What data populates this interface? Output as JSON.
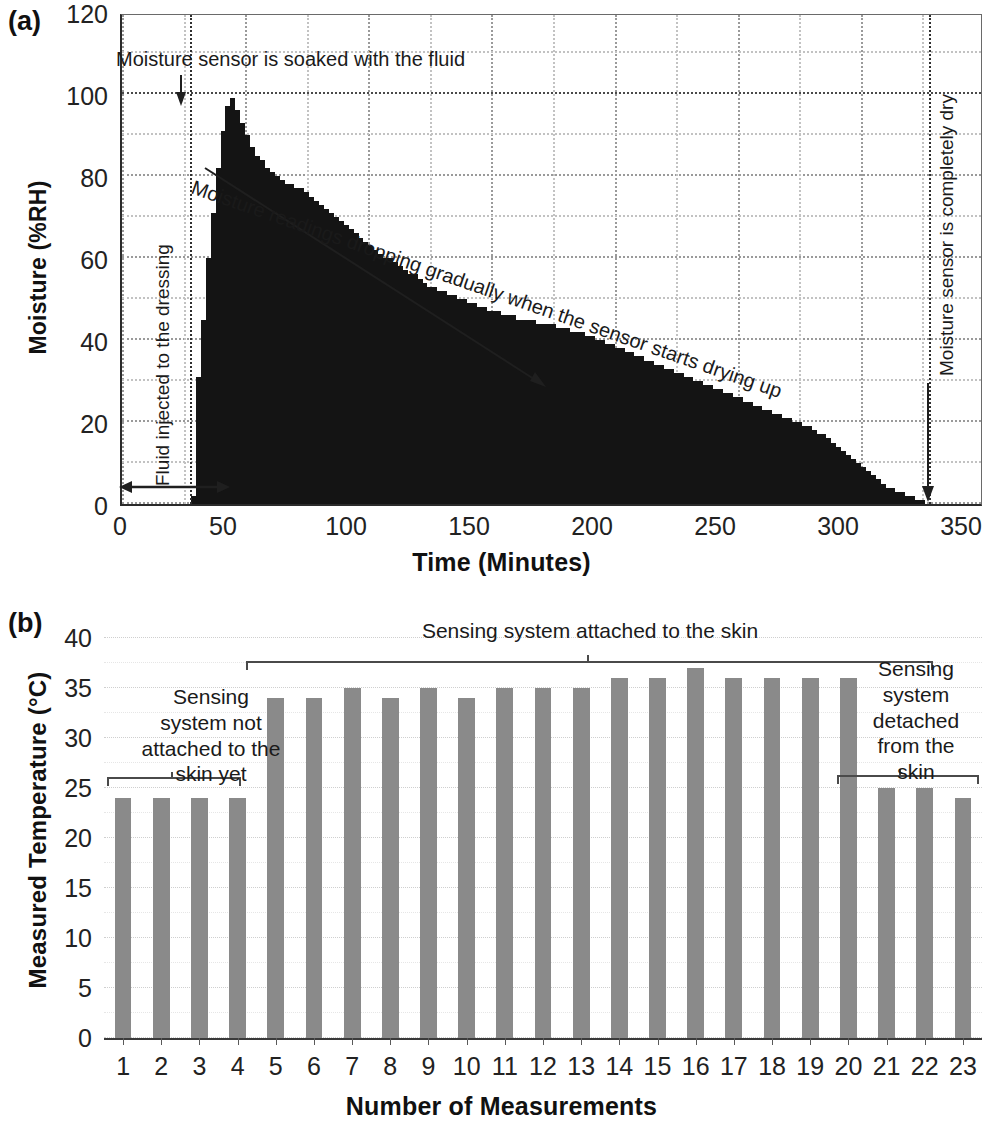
{
  "figure": {
    "panels": [
      {
        "letter": "(a)"
      },
      {
        "letter": "(b)"
      }
    ]
  },
  "panel_a": {
    "letter": "(a)",
    "ylabel": "Moisture (%RH)",
    "xlabel": "Time (Minutes)",
    "yticks": [
      "0",
      "20",
      "40",
      "60",
      "80",
      "100",
      "120"
    ],
    "xticks": [
      "0",
      "50",
      "100",
      "150",
      "200",
      "250",
      "300",
      "350"
    ],
    "annotations": {
      "peak": "Moisture sensor is soaked with the fluid",
      "decay": "Moisture readings dropping gradually when the sensor starts drying up",
      "fluid": "Fluid injected to the dressing",
      "dry": "Moisture sensor is completely dry"
    }
  },
  "panel_b": {
    "letter": "(b)",
    "ylabel": "Measured Temperature (°C)",
    "xlabel": "Number of Measurements",
    "yticks": [
      "0",
      "5",
      "10",
      "15",
      "20",
      "25",
      "30",
      "35",
      "40"
    ],
    "annotations": {
      "not_attached": "Sensing\nsystem not\nattached to the\nskin yet",
      "attached": "Sensing system attached to the skin",
      "detached": "Sensing\nsystem\ndetached\nfrom the\nskin"
    }
  },
  "colors": {
    "bar_a": "#141414",
    "bar_b": "#8a8a8a",
    "axis": "#2b2b2b",
    "grid": "#9a9a9a",
    "text": "#1a1a1a"
  },
  "chart_data": [
    {
      "type": "bar",
      "id": "panel-a-moisture",
      "title": "(a) Moisture sensor response over time",
      "xlabel": "Time (Minutes)",
      "ylabel": "Moisture (%RH)",
      "xlim": [
        0,
        350
      ],
      "ylim": [
        0,
        120
      ],
      "xticks": [
        0,
        50,
        100,
        150,
        200,
        250,
        300,
        350
      ],
      "yticks": [
        0,
        20,
        40,
        60,
        80,
        100,
        120
      ],
      "grid": true,
      "legend": null,
      "bar_color": "#141414",
      "annotations": [
        {
          "text": "Moisture sensor is soaked with the fluid",
          "x": 38,
          "y": 108,
          "arrow_to_x": 38,
          "arrow_to_y": 100
        },
        {
          "text": "Moisture readings dropping gradually when the sensor starts drying up",
          "x": 60,
          "y": 92,
          "rotation": -19
        },
        {
          "text": "Fluid injected to the dressing",
          "x": 14,
          "y": 10,
          "rotation": -90
        },
        {
          "text": "Moisture sensor is completely dry",
          "x": 328,
          "y": 60,
          "rotation": -90,
          "arrow_to_x": 328,
          "arrow_to_y": 1
        }
      ],
      "markers": [
        {
          "type": "vline",
          "x": 28,
          "style": "dotted"
        },
        {
          "type": "vline",
          "x": 328,
          "style": "dotted"
        },
        {
          "type": "vline",
          "x": 340,
          "style": "dotted"
        },
        {
          "type": "double-arrow",
          "x_from": 2,
          "x_to": 28,
          "y": 7
        }
      ],
      "x": [
        1,
        3,
        5,
        7,
        9,
        11,
        13,
        15,
        17,
        19,
        21,
        23,
        25,
        27,
        29,
        31,
        33,
        35,
        37,
        39,
        41,
        43,
        45,
        47,
        49,
        51,
        53,
        55,
        57,
        59,
        61,
        63,
        65,
        67,
        69,
        71,
        73,
        75,
        77,
        79,
        81,
        83,
        85,
        87,
        89,
        91,
        93,
        95,
        97,
        99,
        101,
        103,
        105,
        107,
        109,
        111,
        113,
        115,
        117,
        119,
        121,
        123,
        125,
        127,
        129,
        131,
        133,
        135,
        137,
        139,
        141,
        143,
        145,
        147,
        149,
        151,
        153,
        155,
        157,
        159,
        161,
        163,
        165,
        167,
        169,
        171,
        173,
        175,
        177,
        179,
        181,
        183,
        185,
        187,
        189,
        191,
        193,
        195,
        197,
        199,
        201,
        203,
        205,
        207,
        209,
        211,
        213,
        215,
        217,
        219,
        221,
        223,
        225,
        227,
        229,
        231,
        233,
        235,
        237,
        239,
        241,
        243,
        245,
        247,
        249,
        251,
        253,
        255,
        257,
        259,
        261,
        263,
        265,
        267,
        269,
        271,
        273,
        275,
        277,
        279,
        281,
        283,
        285,
        287,
        289,
        291,
        293,
        295,
        297,
        299,
        301,
        303,
        305,
        307,
        309,
        311,
        313,
        315,
        317,
        319,
        321,
        323,
        325,
        327
      ],
      "values": [
        0,
        0,
        0,
        0,
        0,
        0,
        0,
        0,
        0,
        0,
        0,
        0,
        0,
        0,
        2,
        31,
        45,
        60,
        71,
        82,
        91,
        97,
        99,
        96,
        93,
        90,
        87,
        85,
        84,
        82,
        81,
        80,
        79,
        78,
        78,
        77,
        77,
        76,
        75,
        74,
        73,
        72,
        71,
        70,
        69,
        68,
        67,
        66,
        65,
        64,
        63,
        62,
        61,
        60,
        60,
        59,
        58,
        57,
        56,
        56,
        55,
        54,
        53,
        53,
        52,
        52,
        51,
        51,
        50,
        50,
        49,
        49,
        48,
        48,
        47,
        47,
        47,
        46,
        46,
        46,
        45,
        45,
        45,
        45,
        44,
        44,
        44,
        44,
        43,
        43,
        43,
        42,
        42,
        42,
        41,
        41,
        40,
        40,
        39,
        39,
        38,
        38,
        37,
        37,
        36,
        36,
        35,
        35,
        34,
        34,
        33,
        33,
        32,
        32,
        31,
        31,
        30,
        30,
        29,
        29,
        28,
        28,
        27,
        27,
        26,
        26,
        25,
        25,
        24,
        24,
        23,
        23,
        22,
        22,
        21,
        21,
        20,
        20,
        19,
        19,
        18,
        17,
        17,
        16,
        15,
        14,
        13,
        12,
        11,
        10,
        9,
        8,
        7,
        6,
        5,
        4,
        4,
        3,
        3,
        2,
        2,
        1,
        1,
        0
      ],
      "description": "Moisture rises sharply to ~99 %RH at ~45 min after fluid injection at ~28 min, then decays steadily to 0 %RH at ~328 min."
    },
    {
      "type": "bar",
      "id": "panel-b-temperature",
      "title": "(b) Measured skin temperature across 23 measurements",
      "xlabel": "Number of Measurements",
      "ylabel": "Measured Temperature (°C)",
      "ylim": [
        0,
        40
      ],
      "yticks": [
        0,
        5,
        10,
        15,
        20,
        25,
        30,
        35,
        40
      ],
      "grid": true,
      "legend": null,
      "bar_color": "#8a8a8a",
      "categories": [
        "1",
        "2",
        "3",
        "4",
        "5",
        "6",
        "7",
        "8",
        "9",
        "10",
        "11",
        "12",
        "13",
        "14",
        "15",
        "16",
        "17",
        "18",
        "19",
        "20",
        "21",
        "22",
        "23"
      ],
      "values": [
        24,
        24,
        24,
        24,
        34,
        34,
        35,
        34,
        35,
        34,
        35,
        35,
        35,
        36,
        36,
        37,
        36,
        36,
        36,
        36,
        25,
        25,
        24
      ],
      "groups": [
        {
          "label": "Sensing system not attached to the skin yet",
          "from": 1,
          "to": 4
        },
        {
          "label": "Sensing system attached to the skin",
          "from": 5,
          "to": 20
        },
        {
          "label": "Sensing system detached from the skin",
          "from": 21,
          "to": 23
        }
      ],
      "description": "Temperature reads ~24 °C before skin attachment (1-4), rises to 34-37 °C while attached (5-20), and falls back to 24-25 °C after detachment (21-23)."
    }
  ]
}
